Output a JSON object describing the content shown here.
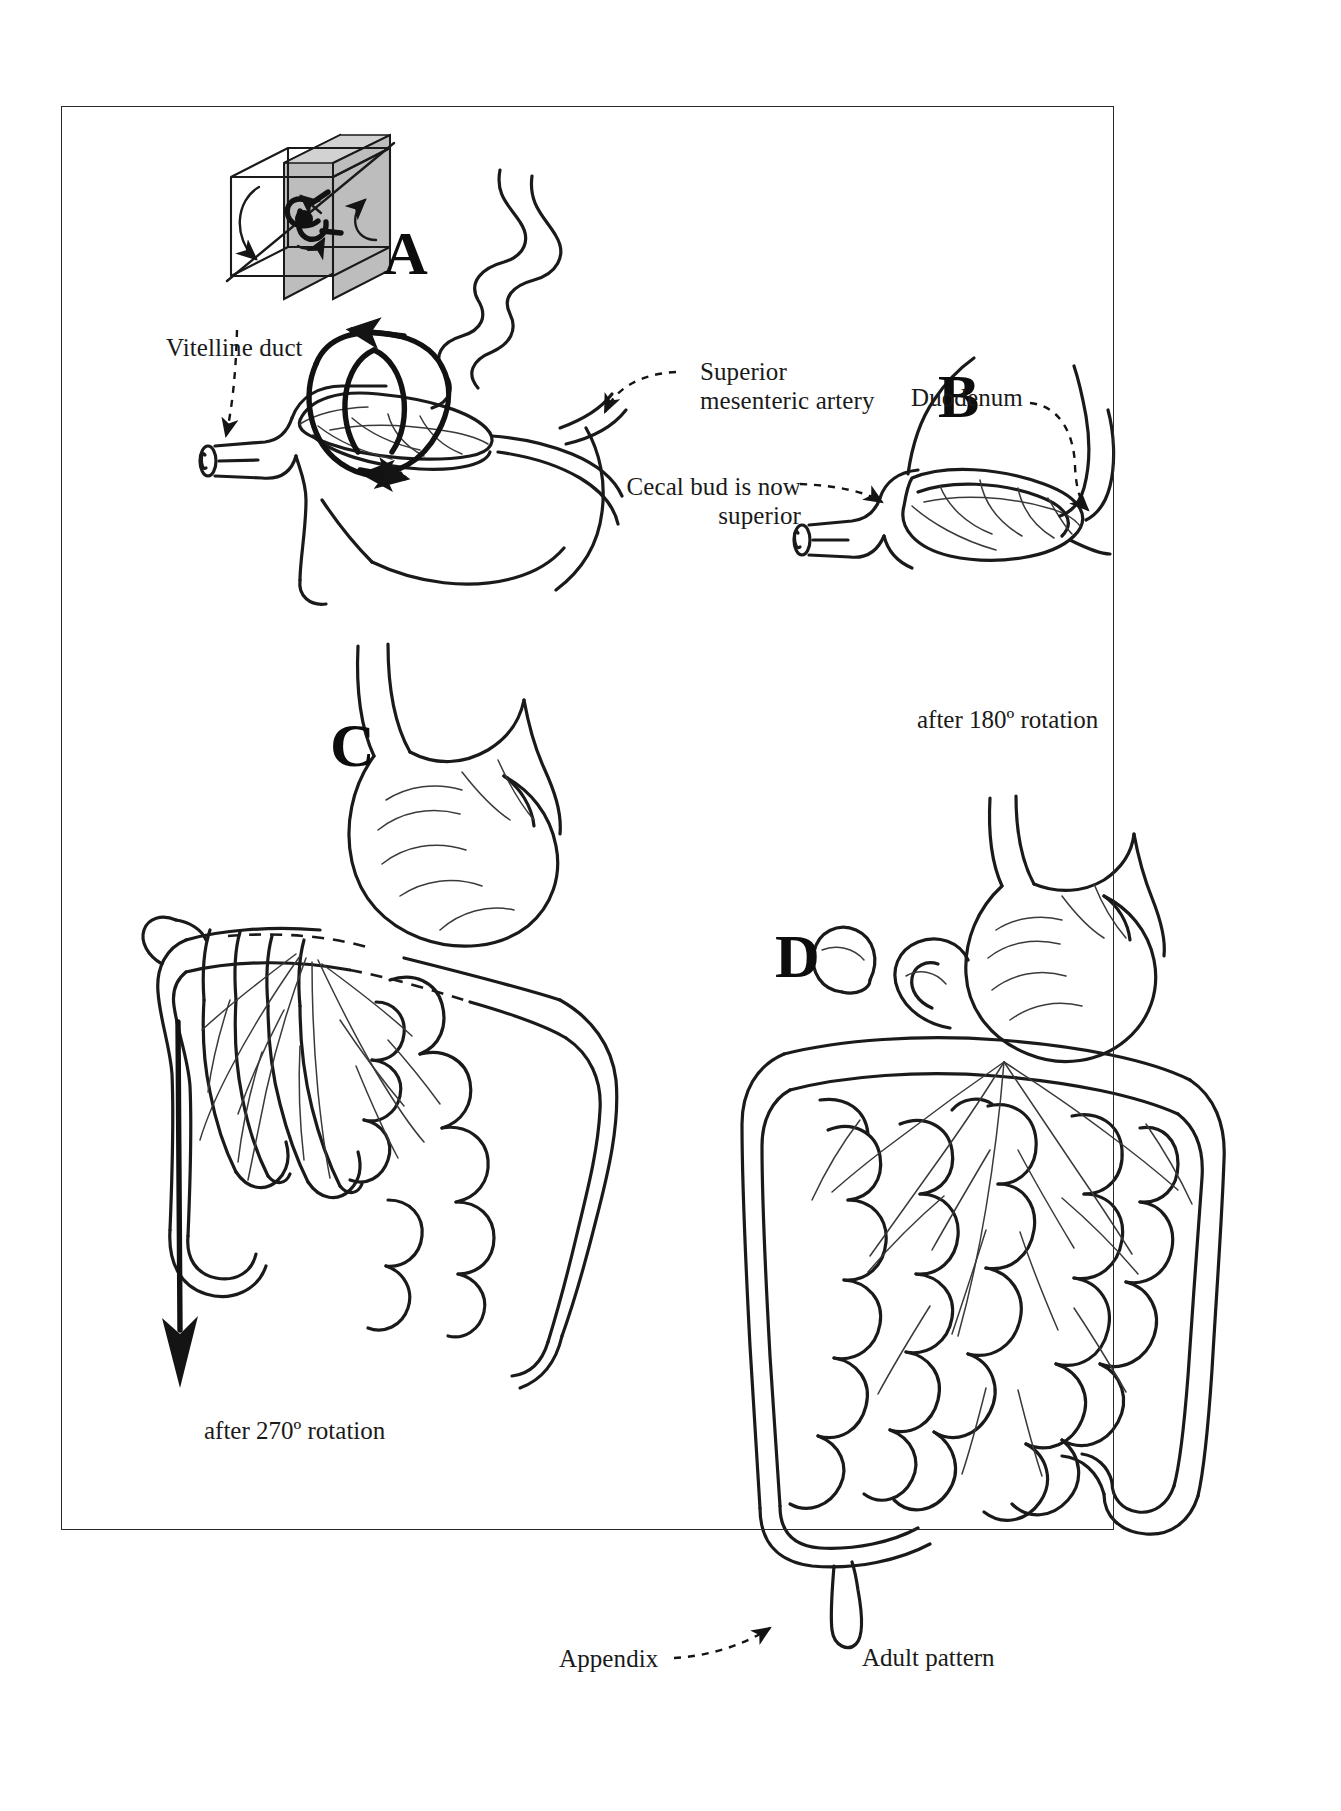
{
  "figure": {
    "background_color": "#ffffff",
    "ink_color": "#1a1a1a",
    "frame_color": "#2a2a2a"
  },
  "panels": [
    {
      "id": "A",
      "letter": "A",
      "caption": ""
    },
    {
      "id": "B",
      "letter": "B",
      "caption": "after 180º rotation"
    },
    {
      "id": "C",
      "letter": "C",
      "caption": "after 270º rotation"
    },
    {
      "id": "D",
      "letter": "D",
      "caption": "Adult pattern"
    }
  ],
  "labels": {
    "vitelline_duct": "Vitelline duct",
    "superior_mesenteric_artery_line1": "Superior",
    "superior_mesenteric_artery_line2": "mesenteric artery",
    "duodenum": "Duodenum",
    "cecal_bud_line1": "Cecal bud is now",
    "cecal_bud_line2": "superior",
    "appendix": "Appendix"
  },
  "captions": {
    "rotation_180": "after 180º rotation",
    "rotation_270": "after 270º rotation",
    "adult_pattern": "Adult pattern"
  },
  "orientation_cube": {
    "name": "orientation-cube",
    "shaded_face_color": "#b9b9b9",
    "outline_color": "#1a1a1a",
    "gut_glyph_color": "#111111",
    "rotation_arrows": 2
  }
}
